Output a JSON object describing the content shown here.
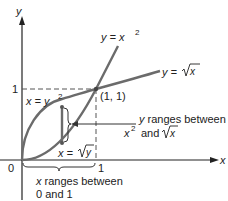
{
  "figure": {
    "axes": {
      "x_label": "x",
      "y_label": "y",
      "origin_label": "0",
      "x_tick_label": "1",
      "y_tick_label": "1"
    },
    "curves": [
      {
        "name": "parabola",
        "label_lhs": "y = x",
        "label_exp": "2",
        "alt_label_lhs": "x = y",
        "alt_label_exp": "2"
      },
      {
        "name": "sqrt",
        "label_lhs": "y = ",
        "label_rad": "x",
        "alt_label_lhs": "x = ",
        "alt_label_rad": "y"
      }
    ],
    "intersection_label": "(1, 1)",
    "annotations": {
      "y_range_line1": "y ranges between",
      "y_range_line2_a": "x",
      "y_range_line2_exp": "2",
      "y_range_line2_b": "and",
      "y_range_line2_rad": "x",
      "x_range_line1": "x ranges between",
      "x_range_line2": "0 and 1"
    },
    "colors": {
      "curve": "#6b6b6b",
      "axis": "#222222",
      "text": "#222222",
      "dashed": "#555555"
    }
  }
}
